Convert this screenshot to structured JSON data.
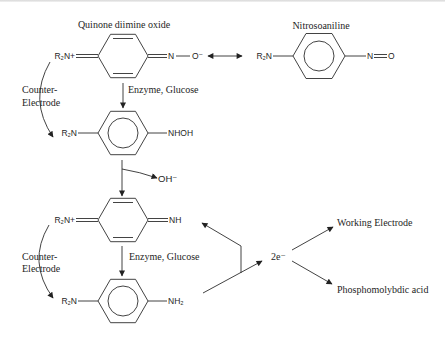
{
  "diagram": {
    "labels": {
      "quinone_diimine_oxide_title": "Quinone diimine oxide",
      "nitrosoaniline_title": "Nitrosoaniline"
    },
    "molecules": {
      "quinone_diimine_oxide": {
        "left_group": "R₂N+",
        "right_n": "N",
        "right_o": "O⁻"
      },
      "nitrosoaniline": {
        "left_group": "R₂N",
        "right_n": "N",
        "right_o": "O"
      },
      "hydroxylamine": {
        "left_group": "R₂N",
        "right_group": "NHOH"
      },
      "quinone_diimine": {
        "left_group": "R₂N+",
        "right_group": "NH"
      },
      "phenylenediamine": {
        "left_group": "R₂N",
        "right_group": "NH₂"
      }
    },
    "reagents": [
      {
        "label": "Enzyme, Glucose"
      },
      {
        "label": "Enzyme, Glucose"
      }
    ],
    "counter_electrode": [
      {
        "line1": "Counter-",
        "line2": "Electrode"
      },
      {
        "line1": "Counter-",
        "line2": "Electrode"
      }
    ],
    "byproduct": "OH⁻",
    "electrons": "2e⁻",
    "electron_targets": [
      {
        "label": "Working Electrode"
      },
      {
        "label": "Phosphomolybdic acid"
      }
    ],
    "colors": {
      "ink": "#1e1e1e",
      "background": "#ffffff"
    }
  }
}
